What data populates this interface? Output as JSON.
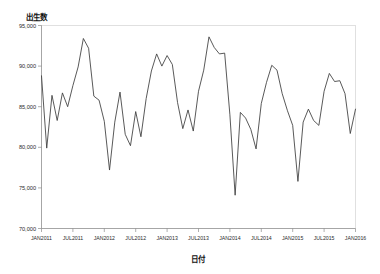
{
  "chart_data": {
    "type": "line",
    "title": "",
    "subtitle": "",
    "ylabel": "出生数",
    "xlabel": "日付",
    "ylim": [
      70000,
      95000
    ],
    "y_ticks": [
      95000,
      90000,
      85000,
      80000,
      75000,
      70000
    ],
    "y_tick_labels": [
      "95,000",
      "90,000",
      "85,000",
      "80,000",
      "75,000",
      "70,000"
    ],
    "x_ticks": [
      "JAN2011",
      "JUL2011",
      "JAN2012",
      "JUL2012",
      "JAN2013",
      "JUL2013",
      "JAN2014",
      "JUL2014",
      "JAN2015",
      "JUL2015",
      "JAN2016"
    ],
    "x_tick_labels": [
      "JAN2011",
      "JUL2011",
      "JAN2012",
      "JUL2012",
      "JAN2013",
      "JUL2013",
      "JAN2014",
      "JUL2014",
      "JAN2015",
      "JUL2015",
      "JAN2016"
    ],
    "grid": false,
    "legend": false,
    "legend_position": "none",
    "line_color": "#3b3b3b",
    "series": [
      {
        "name": "出生数",
        "x": [
          "JAN2011",
          "FEB2011",
          "MAR2011",
          "APR2011",
          "MAY2011",
          "JUN2011",
          "JUL2011",
          "AUG2011",
          "SEP2011",
          "OCT2011",
          "NOV2011",
          "DEC2011",
          "JAN2012",
          "FEB2012",
          "MAR2012",
          "APR2012",
          "MAY2012",
          "JUN2012",
          "JUL2012",
          "AUG2012",
          "SEP2012",
          "OCT2012",
          "NOV2012",
          "DEC2012",
          "JAN2013",
          "FEB2013",
          "MAR2013",
          "APR2013",
          "MAY2013",
          "JUN2013",
          "JUL2013",
          "AUG2013",
          "SEP2013",
          "OCT2013",
          "NOV2013",
          "DEC2013",
          "JAN2014",
          "FEB2014",
          "MAR2014",
          "APR2014",
          "MAY2014",
          "JUN2014",
          "JUL2014",
          "AUG2014",
          "SEP2014",
          "OCT2014",
          "NOV2014",
          "DEC2014",
          "JAN2015",
          "FEB2015",
          "MAR2015",
          "APR2015",
          "MAY2015",
          "JUN2015",
          "JUL2015",
          "AUG2015",
          "SEP2015",
          "OCT2015",
          "NOV2015",
          "DEC2015",
          "JAN2016"
        ],
        "values": [
          88800,
          79900,
          86400,
          83300,
          86700,
          85000,
          87600,
          89900,
          93400,
          92200,
          86300,
          85800,
          83200,
          77200,
          83100,
          86800,
          81600,
          80200,
          84400,
          81300,
          86000,
          89400,
          91500,
          90000,
          91300,
          90200,
          85500,
          82300,
          84600,
          82000,
          86900,
          89500,
          93600,
          92300,
          91500,
          91600,
          84000,
          74100,
          84300,
          83600,
          82200,
          79800,
          85400,
          88000,
          90100,
          89500,
          86600,
          84500,
          82700,
          75800,
          83100,
          84700,
          83300,
          82700,
          86900,
          89100,
          88100,
          88200,
          86600,
          81700,
          84700
        ]
      }
    ]
  },
  "axes": {
    "y_title": "出生数",
    "x_title": "日付"
  }
}
